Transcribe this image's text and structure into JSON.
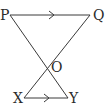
{
  "diagram": {
    "type": "geometry",
    "points": {
      "P": {
        "label": "P",
        "x": 10,
        "y": 15
      },
      "Q": {
        "label": "Q",
        "x": 90,
        "y": 15
      },
      "O": {
        "label": "O",
        "x": 47,
        "y": 68
      },
      "X": {
        "label": "X",
        "x": 24,
        "y": 98
      },
      "Y": {
        "label": "Y",
        "x": 68,
        "y": 98
      }
    },
    "segments": [
      {
        "from": "P",
        "to": "Q",
        "arrow": true
      },
      {
        "from": "X",
        "to": "Y",
        "arrow": true
      },
      {
        "from": "P",
        "to": "Y",
        "arrow": false
      },
      {
        "from": "Q",
        "to": "X",
        "arrow": false
      }
    ],
    "note": "PQ parallel to XY (arrow marks); PY and QX intersect at O"
  },
  "colors": {
    "line": "#3a3a3a",
    "text": "#2b2b2b",
    "background": "#ffffff"
  }
}
